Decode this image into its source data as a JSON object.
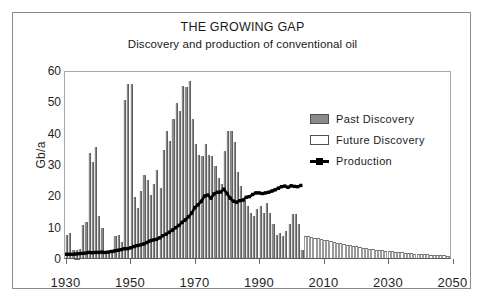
{
  "chart_data": {
    "type": "bar",
    "title": "THE GROWING GAP",
    "subtitle": "Discovery and production of conventional oil",
    "xlabel": "",
    "ylabel": "Gb/a",
    "xlim": [
      1930,
      2050
    ],
    "ylim": [
      0,
      60
    ],
    "ytick_labels": [
      "60",
      "50",
      "40",
      "30",
      "20",
      "10",
      "0"
    ],
    "ytick_values": [
      60,
      50,
      40,
      30,
      20,
      10,
      0
    ],
    "xtick_labels": [
      "1930",
      "1950",
      "1970",
      "1990",
      "2010",
      "2030",
      "2050"
    ],
    "xtick_values": [
      1930,
      1950,
      1970,
      1990,
      2010,
      2030,
      2050
    ],
    "grid": false,
    "legend_position": "upper right",
    "legend": [
      {
        "label": "Past Discovery",
        "key": "filled-gray-swatch",
        "color": "#8a8a8a"
      },
      {
        "label": "Future Discovery",
        "key": "open-white-swatch",
        "color": "#ffffff"
      },
      {
        "label": "Production",
        "key": "black-line-marker",
        "color": "#000000"
      }
    ],
    "series": [
      {
        "name": "Past Discovery",
        "type": "bar",
        "color": "#8a8a8a",
        "x": [
          1930,
          1931,
          1932,
          1933,
          1934,
          1935,
          1936,
          1937,
          1938,
          1939,
          1940,
          1941,
          1942,
          1943,
          1944,
          1945,
          1946,
          1947,
          1948,
          1949,
          1950,
          1951,
          1952,
          1953,
          1954,
          1955,
          1956,
          1957,
          1958,
          1959,
          1960,
          1961,
          1962,
          1963,
          1964,
          1965,
          1966,
          1967,
          1968,
          1969,
          1970,
          1971,
          1972,
          1973,
          1974,
          1975,
          1976,
          1977,
          1978,
          1979,
          1980,
          1981,
          1982,
          1983,
          1984,
          1985,
          1986,
          1987,
          1988,
          1989,
          1990,
          1991,
          1992,
          1993,
          1994,
          1995,
          1996,
          1997,
          1998,
          1999,
          2000,
          2001,
          2002,
          2003
        ],
        "values": [
          7.5,
          8,
          2.5,
          2.5,
          3,
          10.5,
          11.5,
          33.5,
          30.5,
          35.5,
          13.5,
          9.5,
          2,
          2,
          2,
          7,
          7.5,
          5,
          50.5,
          55.5,
          55.5,
          19.5,
          16,
          21.5,
          26.5,
          25,
          20,
          23.5,
          28,
          22.5,
          34.5,
          40.5,
          37.5,
          44.5,
          49.5,
          47,
          55,
          54.5,
          56.5,
          44.5,
          36.5,
          33,
          32.5,
          36.5,
          33,
          32.5,
          29.5,
          25.5,
          23.5,
          34,
          40.5,
          40.5,
          37,
          27.5,
          23,
          18.5,
          16.5,
          14.5,
          13.5,
          15.5,
          16.5,
          14.5,
          17.5,
          14.5,
          11,
          7.5,
          8,
          7,
          8.5,
          11,
          14,
          14,
          11,
          2.5
        ]
      },
      {
        "name": "Future Discovery",
        "type": "bar",
        "color": "#ffffff",
        "x": [
          2004,
          2005,
          2006,
          2007,
          2008,
          2009,
          2010,
          2011,
          2012,
          2013,
          2014,
          2015,
          2016,
          2017,
          2018,
          2019,
          2020,
          2021,
          2022,
          2023,
          2024,
          2025,
          2026,
          2027,
          2028,
          2029,
          2030,
          2031,
          2032,
          2033,
          2034,
          2035,
          2036,
          2037,
          2038,
          2039,
          2040,
          2041,
          2042,
          2043,
          2044,
          2045,
          2046,
          2047,
          2048,
          2049,
          2050
        ],
        "values": [
          7,
          6.9,
          6.7,
          6.5,
          6.3,
          6.0,
          5.8,
          5.6,
          5.4,
          5.1,
          4.9,
          4.7,
          4.5,
          4.3,
          4.1,
          3.9,
          3.7,
          3.5,
          3.3,
          3.2,
          3.0,
          2.9,
          2.7,
          2.6,
          2.4,
          2.3,
          2.2,
          2.1,
          2.0,
          1.9,
          1.8,
          1.7,
          1.6,
          1.5,
          1.4,
          1.35,
          1.3,
          1.2,
          1.15,
          1.1,
          1.0,
          0.95,
          0.9,
          0.85,
          0.8,
          0.75,
          0.7
        ]
      },
      {
        "name": "Production",
        "type": "line",
        "color": "#000000",
        "x": [
          1930,
          1931,
          1932,
          1933,
          1934,
          1935,
          1936,
          1937,
          1938,
          1939,
          1940,
          1941,
          1942,
          1943,
          1944,
          1945,
          1946,
          1947,
          1948,
          1949,
          1950,
          1951,
          1952,
          1953,
          1954,
          1955,
          1956,
          1957,
          1958,
          1959,
          1960,
          1961,
          1962,
          1963,
          1964,
          1965,
          1966,
          1967,
          1968,
          1969,
          1970,
          1971,
          1972,
          1973,
          1974,
          1975,
          1976,
          1977,
          1978,
          1979,
          1980,
          1981,
          1982,
          1983,
          1984,
          1985,
          1986,
          1987,
          1988,
          1989,
          1990,
          1991,
          1992,
          1993,
          1994,
          1995,
          1996,
          1997,
          1998,
          1999,
          2000,
          2001,
          2002,
          2003
        ],
        "values": [
          1.2,
          1.2,
          1.2,
          1.3,
          1.4,
          1.5,
          1.6,
          1.8,
          1.7,
          1.8,
          1.8,
          1.9,
          1.8,
          1.9,
          2.1,
          2.3,
          2.5,
          2.7,
          3.0,
          3.0,
          3.3,
          3.7,
          4.0,
          4.2,
          4.5,
          5.0,
          5.5,
          5.8,
          6.0,
          6.5,
          7.2,
          7.7,
          8.3,
          9.0,
          9.8,
          10.5,
          11.5,
          12.3,
          13.3,
          14.5,
          16.3,
          17.2,
          18.3,
          20.0,
          20.3,
          19.3,
          20.7,
          21.2,
          21.3,
          22.2,
          20.8,
          19.3,
          18.3,
          18.0,
          18.5,
          18.7,
          19.6,
          19.8,
          20.5,
          21.0,
          21.0,
          20.8,
          21.0,
          21.2,
          21.6,
          22.0,
          22.5,
          23.0,
          23.2,
          22.8,
          23.3,
          23.1,
          23.0,
          23.4
        ]
      }
    ]
  }
}
